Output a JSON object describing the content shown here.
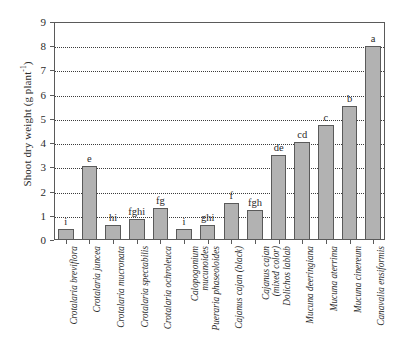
{
  "chart_data": {
    "type": "bar",
    "title": "",
    "xlabel": "",
    "ylabel": "Shoot dry weight (g plant",
    "ylabel_sup": "-1",
    "ylabel_suffix": ")",
    "ylim": [
      0,
      9
    ],
    "yticks": [
      0,
      1,
      2,
      3,
      4,
      5,
      6,
      7,
      8,
      9
    ],
    "ytick_labels": [
      "0",
      "1",
      "2",
      "3",
      "4",
      "5",
      "6",
      "7",
      "8",
      "9"
    ],
    "grid": "horizontal-dotted",
    "legend": "none",
    "bar_color": "#b2b2b2",
    "bar_edge_color": "#5a5a5a",
    "axis_color": "#5a5a5a",
    "categories": [
      "Crotalaria breviflora",
      "Crotalaria juncea",
      "Crotalaria mucronata",
      "Crotalaria spectabilis",
      "Crotalaria ochroleuca",
      "Calopogonium mucunoides",
      "Pueraria phaseoloides",
      "Cajanus cajan (black)",
      "Cajanus cajan (mixed color)",
      "Dolichos lablab",
      "Mucuna deeringiana",
      "Mucuna aterrima",
      "Mucuna cinereum",
      "Canavalia ensiformis"
    ],
    "category_lines": [
      [
        "Crotalaria breviflora"
      ],
      [
        "Crotalaria juncea"
      ],
      [
        "Crotalaria mucronata"
      ],
      [
        "Crotalaria spectabilis"
      ],
      [
        "Crotalaria ochroleuca"
      ],
      [
        "Calopogonium",
        "mucunoides"
      ],
      [
        "Pueraria phaseoloides"
      ],
      [
        "Cajanus cajan (black)"
      ],
      [
        "Cajanus cajan",
        "(mixed color)"
      ],
      [
        "Dolichos lablab"
      ],
      [
        "Mucuna deeringiana"
      ],
      [
        "Mucuna aterrima"
      ],
      [
        "Mucuna cinereum"
      ],
      [
        "Canavalia ensiformis"
      ]
    ],
    "values": [
      0.47,
      3.05,
      0.6,
      0.88,
      1.34,
      0.47,
      0.62,
      1.51,
      1.23,
      3.5,
      4.05,
      4.73,
      5.52,
      8.0
    ],
    "annotations": [
      "i",
      "e",
      "hi",
      "fghi",
      "fg",
      "i",
      "ghi",
      "f",
      "fgh",
      "de",
      "cd",
      "c",
      "b",
      "a"
    ]
  }
}
